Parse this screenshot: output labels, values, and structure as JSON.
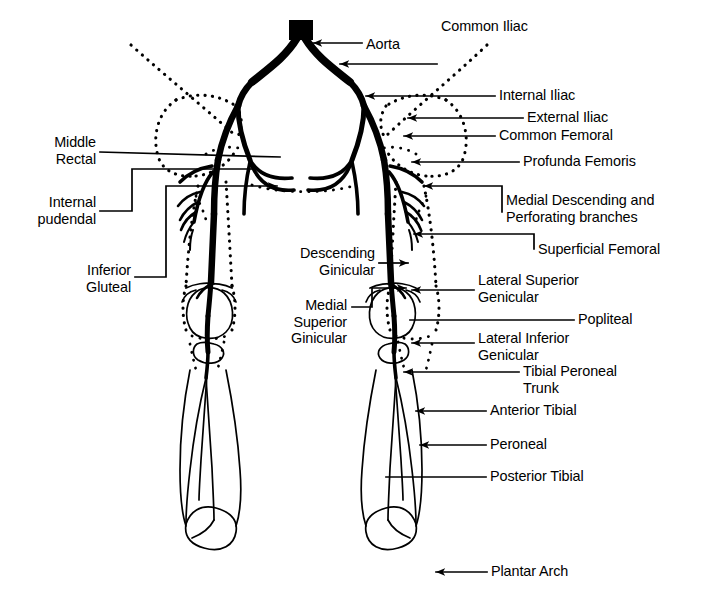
{
  "figure": {
    "background_color": "#ffffff",
    "stroke_color": "#000000",
    "canvas": {
      "width": 715,
      "height": 610
    }
  },
  "labels": {
    "aorta": "Aorta",
    "common_iliac": "Common Iliac",
    "internal_iliac": "Internal Iliac",
    "external_iliac": "External Iliac",
    "common_femoral": "Common Femoral",
    "profunda_femoris": "Profunda Femoris",
    "medial_descending": "Medial Descending and\nPerforating branches",
    "superficial_femoral": "Superficial Femoral",
    "lateral_superior_genicular": "Lateral Superior\nGenicular",
    "popliteal": "Popliteal",
    "lateral_inferior_genicular": "Lateral Inferior\nGenicular",
    "tibial_peroneal_trunk": "Tibial Peroneal\nTrunk",
    "anterior_tibial": "Anterior Tibial",
    "peroneal": "Peroneal",
    "posterior_tibial": "Posterior Tibial",
    "plantar_arch": "Plantar Arch",
    "middle_rectal": "Middle\nRectal",
    "internal_pudendal": "Internal\npudendal",
    "inferior_gluteal": "Inferior\nGluteal",
    "descending_ginicular": "Descending\nGinicular",
    "medial_superior_ginicular": "Medial\nSuperior\nGinicular"
  },
  "label_positions": {
    "aorta": {
      "x": 366,
      "y": 36,
      "align": "left"
    },
    "common_iliac": {
      "x": 441,
      "y": 18,
      "align": "left"
    },
    "internal_iliac": {
      "x": 499,
      "y": 87,
      "align": "left"
    },
    "external_iliac": {
      "x": 527,
      "y": 109,
      "align": "left"
    },
    "common_femoral": {
      "x": 499,
      "y": 127,
      "align": "left"
    },
    "profunda_femoris": {
      "x": 523,
      "y": 153,
      "align": "left"
    },
    "medial_descending": {
      "x": 506,
      "y": 192,
      "align": "left"
    },
    "superficial_femoral": {
      "x": 538,
      "y": 241,
      "align": "left"
    },
    "lateral_superior_genicular": {
      "x": 478,
      "y": 272,
      "align": "left"
    },
    "popliteal": {
      "x": 578,
      "y": 311,
      "align": "left"
    },
    "lateral_inferior_genicular": {
      "x": 478,
      "y": 330,
      "align": "left"
    },
    "tibial_peroneal_trunk": {
      "x": 523,
      "y": 363,
      "align": "left"
    },
    "anterior_tibial": {
      "x": 490,
      "y": 402,
      "align": "left"
    },
    "peroneal": {
      "x": 490,
      "y": 436,
      "align": "left"
    },
    "posterior_tibial": {
      "x": 490,
      "y": 468,
      "align": "left"
    },
    "plantar_arch": {
      "x": 491,
      "y": 563,
      "align": "left"
    },
    "middle_rectal": {
      "x": 96,
      "y": 134,
      "align": "right"
    },
    "internal_pudendal": {
      "x": 96,
      "y": 194,
      "align": "right"
    },
    "inferior_gluteal": {
      "x": 131,
      "y": 262,
      "align": "right"
    },
    "descending_ginicular": {
      "x": 375,
      "y": 245,
      "align": "right"
    },
    "medial_superior_ginicular": {
      "x": 347,
      "y": 297,
      "align": "right"
    }
  },
  "icons": {
    "arrow": "arrow-left-icon",
    "leader": "leader-line"
  }
}
